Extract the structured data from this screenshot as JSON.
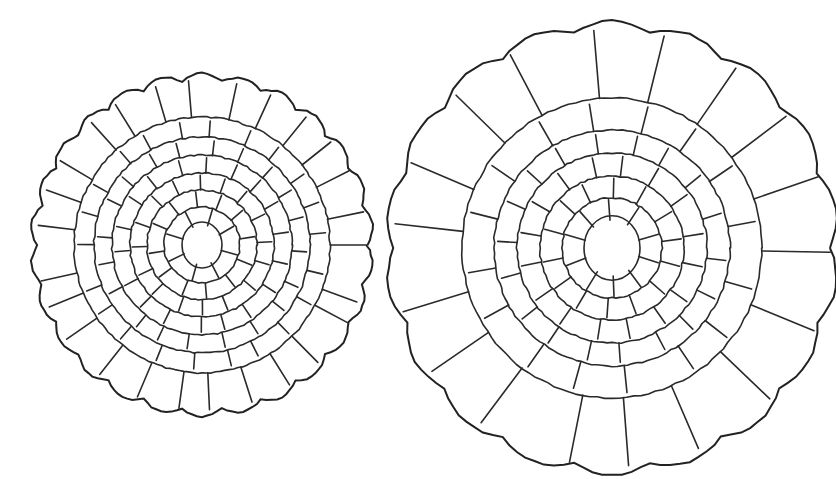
{
  "figure": {
    "background": "#ffffff",
    "stroke_color": "#2a2a2a",
    "sections": [
      {
        "name": "small-root-section",
        "cx": 202,
        "cy": 245,
        "r": 170,
        "rings": [
          {
            "r": 170,
            "cells": 26,
            "inner": 128
          },
          {
            "r": 128,
            "cells": 22,
            "inner": 108
          },
          {
            "r": 108,
            "cells": 20,
            "inner": 90
          },
          {
            "r": 90,
            "cells": 18,
            "inner": 72
          },
          {
            "r": 72,
            "cells": 16,
            "inner": 55
          },
          {
            "r": 55,
            "cells": 12,
            "inner": 38
          },
          {
            "r": 38,
            "cells": 8,
            "inner": 20
          }
        ],
        "core_r": 20
      },
      {
        "name": "large-root-section",
        "cx": 612,
        "cy": 248,
        "r": 225,
        "rings": [
          {
            "r": 225,
            "cells": 18,
            "inner": 150
          },
          {
            "r": 150,
            "cells": 16,
            "inner": 118
          },
          {
            "r": 118,
            "cells": 18,
            "inner": 95
          },
          {
            "r": 95,
            "cells": 16,
            "inner": 72
          },
          {
            "r": 72,
            "cells": 14,
            "inner": 50
          },
          {
            "r": 50,
            "cells": 10,
            "inner": 28
          }
        ],
        "core_r": 28
      }
    ]
  }
}
